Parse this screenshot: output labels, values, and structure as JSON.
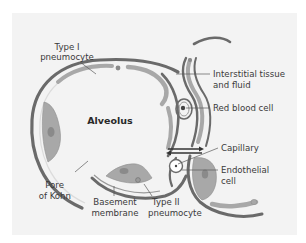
{
  "diagram": {
    "center_label": "Alveolus",
    "labels": {
      "type1_line1": "Type I",
      "type1_line2": "pneumocyte",
      "interstitial_line1": "Interstitial tissue",
      "interstitial_line2": "and fluid",
      "rbc": "Red blood cell",
      "capillary": "Capillary",
      "endothelial_line1": "Endothelial",
      "endothelial_line2": "cell",
      "pore_line1": "Pore",
      "pore_line2": "of Kohn",
      "basement_line1": "Basement",
      "basement_line2": "membrane",
      "type2_line1": "Type II",
      "type2_line2": "pneumocyte"
    },
    "colors": {
      "panel_bg": "#f3f3f3",
      "membrane_dark": "#6a6a6a",
      "cell_fill": "#a8a8a8",
      "nucleus": "#8a8a8a",
      "text": "#3a3a3a"
    }
  }
}
